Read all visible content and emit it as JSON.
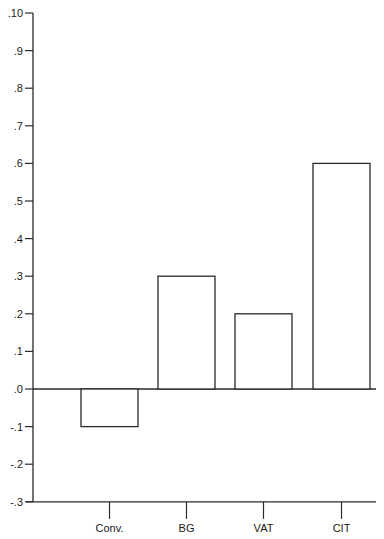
{
  "chart_data": {
    "type": "bar",
    "title": "",
    "xlabel": "",
    "ylabel": "",
    "categories": [
      "Conv.",
      "BG",
      "VAT",
      "CIT"
    ],
    "values": [
      -0.1,
      0.3,
      0.2,
      0.6
    ],
    "ylim": [
      -0.3,
      1.0
    ],
    "yticks": [
      1.0,
      0.9,
      0.8,
      0.7,
      0.6,
      0.5,
      0.4,
      0.3,
      0.2,
      0.1,
      0.0,
      -0.1,
      -0.2,
      -0.3
    ],
    "ytick_labels": [
      ".10",
      ".9",
      ".8",
      ".7",
      ".6",
      ".5",
      ".4",
      ".3",
      ".2",
      ".1",
      ".0",
      "-.1",
      "-.2",
      "-.3"
    ],
    "grid": false,
    "legend": null,
    "bar_fill": "#ffffff",
    "bar_stroke": "#2a2a2a"
  }
}
